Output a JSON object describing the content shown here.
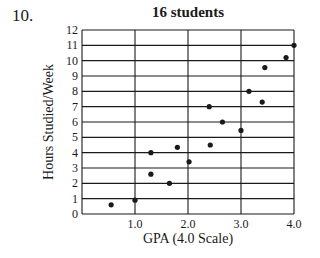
{
  "problem": {
    "number": "10."
  },
  "chart_data": {
    "type": "scatter",
    "title": "16 students",
    "xlabel": "GPA (4.0 Scale)",
    "ylabel": "Hours Studied/Week",
    "xlim": [
      0,
      4.0
    ],
    "ylim": [
      0,
      12
    ],
    "x_ticks": [
      "1.0",
      "2.0",
      "3.0",
      "4.0"
    ],
    "x_tick_values": [
      1,
      2,
      3,
      4
    ],
    "y_ticks": [
      "0",
      "1",
      "2",
      "3",
      "4",
      "5",
      "6",
      "7",
      "8",
      "9",
      "10",
      "11",
      "12"
    ],
    "grid": true,
    "legend": null,
    "points": [
      {
        "x": 0.55,
        "y": 0.6
      },
      {
        "x": 1.0,
        "y": 0.9
      },
      {
        "x": 1.3,
        "y": 2.6
      },
      {
        "x": 1.3,
        "y": 4.0
      },
      {
        "x": 1.65,
        "y": 2.0
      },
      {
        "x": 1.8,
        "y": 4.35
      },
      {
        "x": 2.02,
        "y": 3.4
      },
      {
        "x": 2.42,
        "y": 4.5
      },
      {
        "x": 2.4,
        "y": 7.0
      },
      {
        "x": 2.65,
        "y": 6.0
      },
      {
        "x": 3.0,
        "y": 5.45
      },
      {
        "x": 3.15,
        "y": 8.0
      },
      {
        "x": 3.4,
        "y": 7.3
      },
      {
        "x": 3.45,
        "y": 9.55
      },
      {
        "x": 3.85,
        "y": 10.2
      },
      {
        "x": 4.0,
        "y": 11.0
      }
    ]
  },
  "colors": {
    "ink": "#1a1a1a",
    "background": "#ffffff"
  }
}
